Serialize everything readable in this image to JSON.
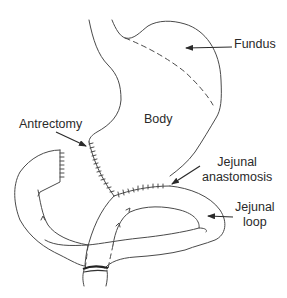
{
  "diagram": {
    "labels": {
      "fundus": "Fundus",
      "body": "Body",
      "antrectomy": "Antrectomy",
      "jejunal_anastomosis_line1": "Jejunal",
      "jejunal_anastomosis_line2": "anastomosis",
      "jejunal_loop_line1": "Jejunal",
      "jejunal_loop_line2": "loop"
    },
    "colors": {
      "line": "#4a4a4a",
      "text": "#2a2a2a",
      "background": "#ffffff"
    }
  }
}
